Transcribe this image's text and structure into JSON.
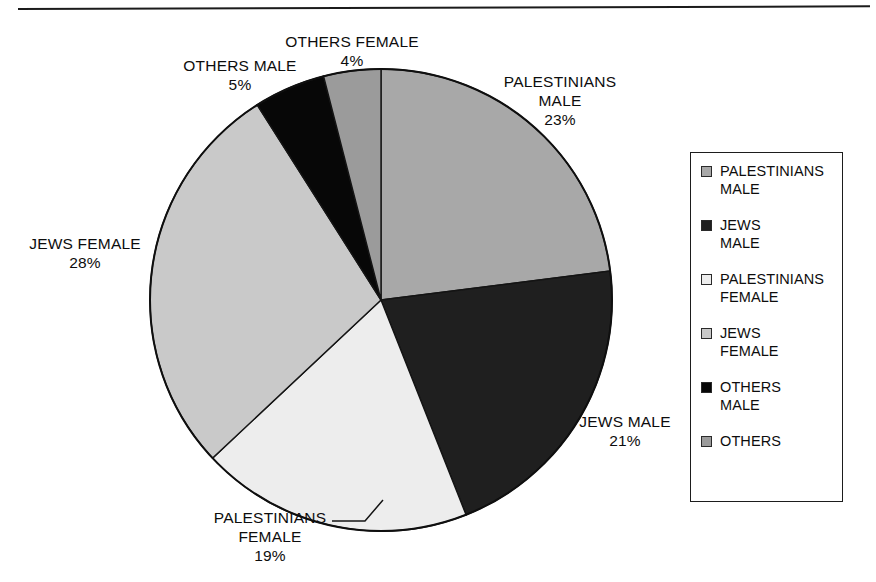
{
  "figure": {
    "background": "#ffffff",
    "top_rule": true
  },
  "chart_data": {
    "type": "pie",
    "title": "",
    "subtitle": "",
    "xlabel": "",
    "ylabel": "",
    "grid": false,
    "legend_position": "right",
    "start_angle_deg": 0,
    "direction": "clockwise",
    "value_unit": "percent",
    "categories": [
      "PALESTINIANS MALE",
      "JEWS MALE",
      "PALESTINIANS FEMALE",
      "JEWS FEMALE",
      "OTHERS MALE",
      "OTHERS FEMALE"
    ],
    "values": [
      23,
      21,
      19,
      28,
      5,
      4
    ],
    "colors": [
      "#a8a8a8",
      "#1f1f1f",
      "#ededed",
      "#c9c9c9",
      "#070707",
      "#9b9b9b"
    ],
    "slices": [
      {
        "label": "PALESTINIANS MALE",
        "value": 23,
        "display_value": "23%",
        "color": "#a8a8a8",
        "start_deg": 0,
        "sweep_deg": 82.8
      },
      {
        "label": "JEWS MALE",
        "value": 21,
        "display_value": "21%",
        "color": "#1f1f1f",
        "start_deg": 82.8,
        "sweep_deg": 75.6
      },
      {
        "label": "PALESTINIANS FEMALE",
        "value": 19,
        "display_value": "19%",
        "color": "#ededed",
        "start_deg": 158.4,
        "sweep_deg": 68.4
      },
      {
        "label": "JEWS FEMALE",
        "value": 28,
        "display_value": "28%",
        "color": "#c9c9c9",
        "start_deg": 226.8,
        "sweep_deg": 100.8
      },
      {
        "label": "OTHERS MALE",
        "value": 5,
        "display_value": "5%",
        "color": "#070707",
        "start_deg": 327.6,
        "sweep_deg": 18.0
      },
      {
        "label": "OTHERS FEMALE",
        "value": 4,
        "display_value": "4%",
        "color": "#9b9b9b",
        "start_deg": 345.6,
        "sweep_deg": 14.4
      }
    ]
  },
  "callouts": {
    "others_female": {
      "name": "OTHERS FEMALE",
      "percent": "4%",
      "text": "OTHERS FEMALE\n4%"
    },
    "others_male": {
      "name": "OTHERS MALE",
      "percent": "5%",
      "text": "OTHERS MALE\n5%"
    },
    "palestinians_male": {
      "name": "PALESTINIANS MALE",
      "percent": "23%",
      "text": "PALESTINIANS\nMALE\n23%"
    },
    "jews_male": {
      "name": "JEWS MALE",
      "percent": "21%",
      "text": "JEWS MALE\n21%"
    },
    "jews_female": {
      "name": "JEWS FEMALE",
      "percent": "28%",
      "text": "JEWS FEMALE\n28%"
    },
    "palestinians_female": {
      "name": "PALESTINIANS FEMALE",
      "percent": "19%",
      "text": "PALESTINIANS\nFEMALE\n19%"
    }
  },
  "legend": {
    "border_color": "#1d1d1d",
    "items": [
      {
        "label": "PALESTINIANS\nMALE",
        "swatch_color": "#a8a8a8",
        "swatch_name": "legend-swatch-palestinians-male"
      },
      {
        "label": "JEWS\nMALE",
        "swatch_color": "#1f1f1f",
        "swatch_name": "legend-swatch-jews-male"
      },
      {
        "label": "PALESTINIANS\nFEMALE",
        "swatch_color": "#ededed",
        "swatch_name": "legend-swatch-palestinians-female"
      },
      {
        "label": "JEWS\nFEMALE",
        "swatch_color": "#c9c9c9",
        "swatch_name": "legend-swatch-jews-female"
      },
      {
        "label": "OTHERS\nMALE",
        "swatch_color": "#070707",
        "swatch_name": "legend-swatch-others-male"
      },
      {
        "label": "OTHERS",
        "swatch_color": "#9b9b9b",
        "swatch_name": "legend-swatch-others"
      }
    ]
  }
}
